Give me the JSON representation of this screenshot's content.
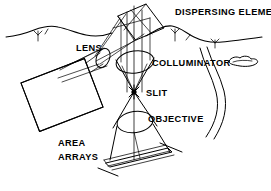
{
  "figure": {
    "background_color": "#ffffff",
    "ink_color": "#000000",
    "width": 271,
    "height": 191
  },
  "labels": {
    "dispersing_element": "DISPERSING ELEMENT",
    "lens": "LENS",
    "colluminator": "COLLUMINATOR",
    "slit": "SLIT",
    "objective": "OBJECTIVE",
    "area_arrays_line1": "AREA",
    "area_arrays_line2": "ARRAYS"
  },
  "components": {
    "dispersing_element": {
      "name": "dispersing-element",
      "shape": "tilted-quadrilateral-plate"
    },
    "colluminator_lens": {
      "name": "colluminator-lens",
      "shape": "ellipse"
    },
    "objective_lens": {
      "name": "objective-lens",
      "shape": "ellipse"
    },
    "slit": {
      "name": "slit-point",
      "shape": "star-crossing-point"
    },
    "entrance_aperture": {
      "name": "entrance-aperture-plate",
      "shape": "hatched-strip-in-perspective"
    },
    "area_arrays": {
      "name": "area-array-detector",
      "shape": "tilted-grid-panel",
      "grid_columns": 16,
      "grid_rows": 13
    },
    "focusing_lens": {
      "name": "focusing-lens",
      "shape": "small-ellipse"
    }
  },
  "scenery": {
    "terrain_left": "mountain-ridge-outline",
    "terrain_right": "mountain-ridge-outline",
    "cloud": "small-cloud",
    "river": "winding-river-double-line",
    "trees": "tree-tick-marks"
  }
}
